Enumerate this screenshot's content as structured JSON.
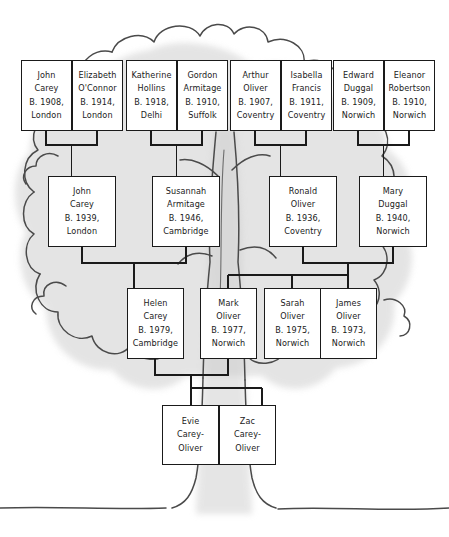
{
  "diagram": {
    "kind": "family-tree",
    "style": "hand-drawn tree illustration with shaded foliage and trunk",
    "colors": {
      "box_border": "#1a1a1a",
      "box_fill": "#ffffff",
      "connector": "#1a1a1a",
      "foliage_outline": "#4a4a4a",
      "foliage_shade": "#d8d8d8",
      "background": "#ffffff",
      "ground_line": "#4a4a4a"
    }
  },
  "generations": [
    {
      "name": "great-grandparents",
      "people": [
        {
          "id": "john-carey-sr",
          "given": "John",
          "family": "Carey",
          "birth": "B. 1908,",
          "place": "London"
        },
        {
          "id": "elizabeth-oconnor",
          "given": "Elizabeth",
          "family": "O'Connor",
          "birth": "B. 1914,",
          "place": "London"
        },
        {
          "id": "katherine-hollins",
          "given": "Katherine",
          "family": "Hollins",
          "birth": "B. 1918,",
          "place": "Delhi"
        },
        {
          "id": "gordon-armitage",
          "given": "Gordon",
          "family": "Armitage",
          "birth": "B. 1910,",
          "place": "Suffolk"
        },
        {
          "id": "arthur-oliver",
          "given": "Arthur",
          "family": "Oliver",
          "birth": "B. 1907,",
          "place": "Coventry"
        },
        {
          "id": "isabella-francis",
          "given": "Isabella",
          "family": "Francis",
          "birth": "B. 1911,",
          "place": "Coventry"
        },
        {
          "id": "edward-duggal",
          "given": "Edward",
          "family": "Duggal",
          "birth": "B. 1909,",
          "place": "Norwich"
        },
        {
          "id": "eleanor-robertson",
          "given": "Eleanor",
          "family": "Robertson",
          "birth": "B. 1910,",
          "place": "Norwich"
        }
      ]
    },
    {
      "name": "grandparents",
      "people": [
        {
          "id": "john-carey",
          "given": "John",
          "family": "Carey",
          "birth": "B. 1939,",
          "place": "London"
        },
        {
          "id": "susannah-armitage",
          "given": "Susannah",
          "family": "Armitage",
          "birth": "B. 1946,",
          "place": "Cambridge"
        },
        {
          "id": "ronald-oliver",
          "given": "Ronald",
          "family": "Oliver",
          "birth": "B. 1936,",
          "place": "Coventry"
        },
        {
          "id": "mary-duggal",
          "given": "Mary",
          "family": "Duggal",
          "birth": "B. 1940,",
          "place": "Norwich"
        }
      ]
    },
    {
      "name": "parents",
      "people": [
        {
          "id": "helen-carey",
          "given": "Helen",
          "family": "Carey",
          "birth": "B. 1979,",
          "place": "Cambridge"
        },
        {
          "id": "mark-oliver",
          "given": "Mark",
          "family": "Oliver",
          "birth": "B. 1977,",
          "place": "Norwich"
        },
        {
          "id": "sarah-oliver",
          "given": "Sarah",
          "family": "Oliver",
          "birth": "B. 1975,",
          "place": "Norwich"
        },
        {
          "id": "james-oliver",
          "given": "James",
          "family": "Oliver",
          "birth": "B. 1973,",
          "place": "Norwich"
        }
      ]
    },
    {
      "name": "children",
      "people": [
        {
          "id": "evie-carey-oliver",
          "given": "Evie",
          "family": "Carey-",
          "birth": "Oliver",
          "place": ""
        },
        {
          "id": "zac-carey-oliver",
          "given": "Zac",
          "family": "Carey-",
          "birth": "Oliver",
          "place": ""
        }
      ]
    }
  ],
  "unions": [
    {
      "id": "union-carey-oconnor",
      "partners": [
        "john-carey-sr",
        "elizabeth-oconnor"
      ],
      "children": [
        "john-carey"
      ]
    },
    {
      "id": "union-hollins-armitage",
      "partners": [
        "katherine-hollins",
        "gordon-armitage"
      ],
      "children": [
        "susannah-armitage"
      ]
    },
    {
      "id": "union-oliver-francis",
      "partners": [
        "arthur-oliver",
        "isabella-francis"
      ],
      "children": [
        "ronald-oliver"
      ]
    },
    {
      "id": "union-duggal-robertson",
      "partners": [
        "edward-duggal",
        "eleanor-robertson"
      ],
      "children": [
        "mary-duggal"
      ]
    },
    {
      "id": "union-john-susannah",
      "partners": [
        "john-carey",
        "susannah-armitage"
      ],
      "children": [
        "helen-carey"
      ]
    },
    {
      "id": "union-ronald-mary",
      "partners": [
        "ronald-oliver",
        "mary-duggal"
      ],
      "children": [
        "mark-oliver",
        "sarah-oliver",
        "james-oliver"
      ]
    },
    {
      "id": "union-helen-mark",
      "partners": [
        "helen-carey",
        "mark-oliver"
      ],
      "children": [
        "evie-carey-oliver",
        "zac-carey-oliver"
      ]
    }
  ]
}
